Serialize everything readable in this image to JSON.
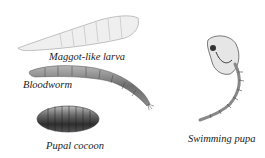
{
  "figure": {
    "labels": {
      "maggot": "Maggot-like larva",
      "bloodworm": "Bloodworm",
      "cocoon": "Pupal cocoon",
      "pupa": "Swimming pupa"
    }
  }
}
